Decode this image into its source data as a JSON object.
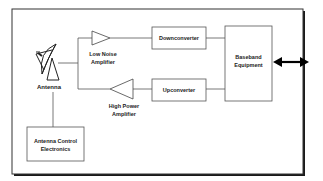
{
  "diagram": {
    "type": "block-diagram",
    "colors": {
      "line": "#2a2a2a",
      "frame": "#111111",
      "background": "#ffffff"
    },
    "blocks": {
      "antenna": {
        "label": "Antenna",
        "icon": "satellite-dish-icon"
      },
      "lna": {
        "label_line1": "Low Noise",
        "label_line2": "Amplifier"
      },
      "hpa": {
        "label_line1": "High Power",
        "label_line2": "Amplifier"
      },
      "downconverter": {
        "label": "Downconverter"
      },
      "upconverter": {
        "label": "Upconverter"
      },
      "baseband": {
        "label_line1": "Baseband",
        "label_line2": "Equipment"
      },
      "antenna_control": {
        "label_line1": "Antenna Control",
        "label_line2": "Electronics"
      }
    },
    "connections": [
      {
        "from": "antenna",
        "to": "lna"
      },
      {
        "from": "lna",
        "to": "downconverter"
      },
      {
        "from": "downconverter",
        "to": "baseband"
      },
      {
        "from": "baseband",
        "to": "upconverter"
      },
      {
        "from": "upconverter",
        "to": "hpa"
      },
      {
        "from": "hpa",
        "to": "antenna"
      },
      {
        "from": "antenna",
        "to": "antenna_control"
      },
      {
        "from": "baseband",
        "to": "external",
        "style": "bidirectional-arrow"
      }
    ]
  }
}
